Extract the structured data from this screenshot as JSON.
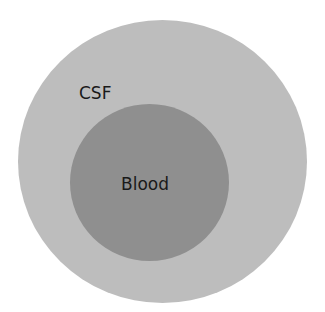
{
  "diagram": {
    "outer_circle": {
      "label": "CSF",
      "color": "#bdbdbd"
    },
    "inner_circle": {
      "label": "Blood",
      "color": "#8f8f8f"
    }
  }
}
